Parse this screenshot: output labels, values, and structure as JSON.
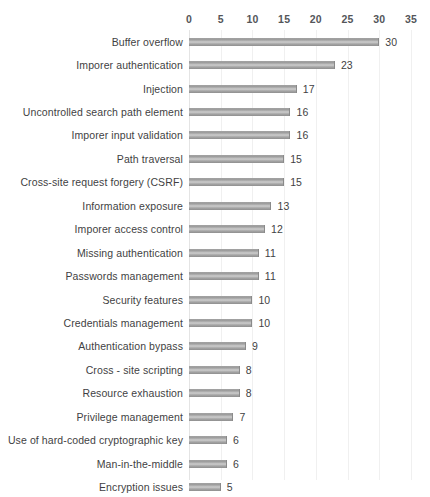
{
  "chart_data": {
    "type": "bar",
    "orientation": "horizontal",
    "title": "",
    "xlabel": "",
    "ylabel": "",
    "xlim": [
      0,
      35
    ],
    "xticks": [
      0,
      5,
      10,
      15,
      20,
      25,
      30,
      35
    ],
    "grid": "vertical",
    "legend": "none",
    "show_value_labels": true,
    "bar_color": "#b0b0b0",
    "categories": [
      "Buffer overflow",
      "Imporer authentication",
      "Injection",
      "Uncontrolled search path element",
      "Imporer input validation",
      "Path traversal",
      "Cross-site request forgery (CSRF)",
      "Information exposure",
      "Imporer access control",
      "Missing authentication",
      "Passwords management",
      "Security features",
      "Credentials management",
      "Authentication bypass",
      "Cross - site scripting",
      "Resource exhaustion",
      "Privilege management",
      "Use of hard-coded cryptographic key",
      "Man-in-the-middle",
      "Encryption issues"
    ],
    "values": [
      30,
      23,
      17,
      16,
      16,
      15,
      15,
      13,
      12,
      11,
      11,
      10,
      10,
      9,
      8,
      8,
      7,
      6,
      6,
      5
    ]
  },
  "colors": {
    "background": "#ffffff",
    "gridline": "#f0f0f0",
    "axis_zero_line": "#e4e4e4",
    "tick_text": "#54565a",
    "label_text": "#3f3f43"
  }
}
